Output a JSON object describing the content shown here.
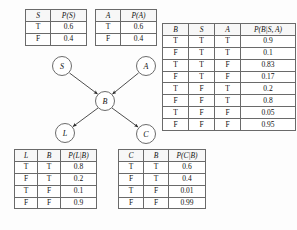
{
  "figure": {
    "type": "bayesian-network-with-cpts"
  },
  "network": {
    "nodes": [
      {
        "id": "S",
        "label": "S",
        "cx": 62,
        "cy": 66
      },
      {
        "id": "A",
        "label": "A",
        "cx": 146,
        "cy": 66
      },
      {
        "id": "B",
        "label": "B",
        "cx": 105,
        "cy": 101
      },
      {
        "id": "L",
        "label": "L",
        "cx": 65,
        "cy": 133
      },
      {
        "id": "C",
        "label": "C",
        "cx": 146,
        "cy": 134
      }
    ],
    "edges": [
      {
        "from": "S",
        "to": "B"
      },
      {
        "from": "A",
        "to": "B"
      },
      {
        "from": "B",
        "to": "L"
      },
      {
        "from": "B",
        "to": "C"
      }
    ]
  },
  "tables": {
    "s": {
      "name": "prior-s",
      "headers": [
        "S",
        "P(S)"
      ],
      "rows": [
        [
          "T",
          "0.6"
        ],
        [
          "F",
          "0.4"
        ]
      ]
    },
    "a": {
      "name": "prior-a",
      "headers": [
        "A",
        "P(A)"
      ],
      "rows": [
        [
          "T",
          "0.6"
        ],
        [
          "F",
          "0.4"
        ]
      ]
    },
    "b": {
      "name": "cpt-b-given-s-a",
      "headers": [
        "B",
        "S",
        "A",
        "P(B|S, A)"
      ],
      "rows": [
        [
          "T",
          "T",
          "T",
          "0.9"
        ],
        [
          "F",
          "T",
          "T",
          "0.1"
        ],
        [
          "T",
          "T",
          "F",
          "0.83"
        ],
        [
          "F",
          "T",
          "F",
          "0.17"
        ],
        [
          "T",
          "F",
          "T",
          "0.2"
        ],
        [
          "F",
          "F",
          "T",
          "0.8"
        ],
        [
          "T",
          "F",
          "F",
          "0.05"
        ],
        [
          "F",
          "F",
          "F",
          "0.95"
        ]
      ]
    },
    "l": {
      "name": "cpt-l-given-b",
      "headers": [
        "L",
        "B",
        "P(L|B)"
      ],
      "rows": [
        [
          "T",
          "T",
          "0.8"
        ],
        [
          "F",
          "T",
          "0.2"
        ],
        [
          "T",
          "F",
          "0.1"
        ],
        [
          "F",
          "F",
          "0.9"
        ]
      ]
    },
    "c": {
      "name": "cpt-c-given-b",
      "headers": [
        "C",
        "B",
        "P(C|B)"
      ],
      "rows": [
        [
          "T",
          "T",
          "0.6"
        ],
        [
          "F",
          "T",
          "0.4"
        ],
        [
          "T",
          "F",
          "0.01"
        ],
        [
          "F",
          "F",
          "0.99"
        ]
      ]
    }
  },
  "colors": {
    "line": "#3a3a3a",
    "node_stroke": "#5a5a5a",
    "table_border": "#6a6a6a",
    "text": "#111111",
    "background": "#fdfdfd"
  }
}
